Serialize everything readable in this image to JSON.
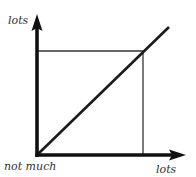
{
  "diagram": {
    "type": "line-relationship",
    "labels": {
      "y_axis_top": "lots",
      "origin": "not much",
      "x_axis_right": "lots"
    },
    "colors": {
      "axis": "#111111",
      "line": "#1a1a1a",
      "guide": "#333333",
      "text": "#333333"
    },
    "geometry": {
      "origin": [
        37,
        155
      ],
      "y_arrow_tip": [
        37,
        14
      ],
      "x_arrow_tip": [
        186,
        155
      ],
      "diagonal_end": [
        169,
        27
      ],
      "guide_point": [
        143,
        51
      ]
    }
  }
}
